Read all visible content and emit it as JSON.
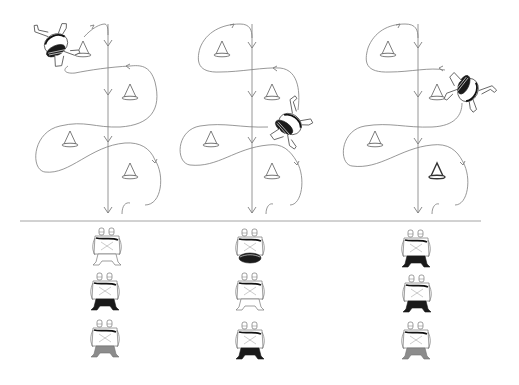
{
  "diagram": {
    "title": "",
    "colors": {
      "line": "#7d7d7d",
      "cone": "#5a5a5a",
      "dark_fill": "#1a1a1a",
      "grey_fill": "#8c8c8c",
      "background": "#ffffff"
    },
    "panels": [
      {
        "id": "panel-1",
        "fall_line_x": 108,
        "cones": [
          {
            "x": 83,
            "y": 50,
            "bold": false
          },
          {
            "x": 130,
            "y": 93,
            "bold": false
          },
          {
            "x": 70,
            "y": 140,
            "bold": false
          },
          {
            "x": 130,
            "y": 172,
            "bold": false
          }
        ],
        "skydiver": {
          "x": 58,
          "y": 42,
          "rotation": -30,
          "icon": "skydiver-icon"
        },
        "formations": [
          {
            "y": 230,
            "leg_style": "white"
          },
          {
            "y": 275,
            "leg_style": "dark"
          },
          {
            "y": 320,
            "leg_style": "grey"
          }
        ]
      },
      {
        "id": "panel-2",
        "fall_line_x": 252,
        "cones": [
          {
            "x": 222,
            "y": 50,
            "bold": false
          },
          {
            "x": 272,
            "y": 93,
            "bold": false
          },
          {
            "x": 211,
            "y": 140,
            "bold": false
          },
          {
            "x": 272,
            "y": 172,
            "bold": false
          }
        ],
        "skydiver": {
          "x": 290,
          "y": 122,
          "rotation": 20,
          "icon": "skydiver-icon"
        },
        "formations": [
          {
            "y": 230,
            "leg_style": "dark-band"
          },
          {
            "y": 275,
            "leg_style": "white"
          },
          {
            "y": 320,
            "leg_style": "dark"
          }
        ]
      },
      {
        "id": "panel-3",
        "fall_line_x": 418,
        "cones": [
          {
            "x": 388,
            "y": 50,
            "bold": false
          },
          {
            "x": 437,
            "y": 93,
            "bold": false
          },
          {
            "x": 375,
            "y": 140,
            "bold": false
          },
          {
            "x": 437,
            "y": 172,
            "bold": false,
            "note": "drawn bolder"
          }
        ],
        "skydiver": {
          "x": 470,
          "y": 88,
          "rotation": 110,
          "icon": "skydiver-icon"
        },
        "formations": [
          {
            "y": 230,
            "leg_style": "dark"
          },
          {
            "y": 275,
            "leg_style": "dark"
          },
          {
            "y": 320,
            "leg_style": "grey"
          }
        ]
      }
    ],
    "divider": {
      "y": 221,
      "x1": 20,
      "x2": 481
    }
  }
}
